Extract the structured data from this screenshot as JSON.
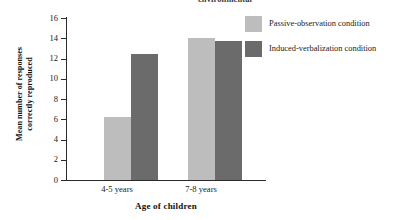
{
  "figure": {
    "cut_off_title": "environmental",
    "background_color": "#ffffff"
  },
  "legend": {
    "position": "top-right",
    "items": [
      {
        "label": "Passive-observation condition",
        "color": "#bdbdbd",
        "swatch_name": "legend-swatch-passive-observation"
      },
      {
        "label": "Induced-verbalization condition",
        "color": "#6b6b6b",
        "swatch_name": "legend-swatch-induced-verbalization"
      }
    ]
  },
  "axes": {
    "y_title_line1": "Mean number of responses",
    "y_title_line2": "correctly reproduced",
    "x_title": "Age of children",
    "y_ticks": [
      "16",
      "14",
      "12",
      "10",
      "8",
      "6",
      "4",
      "2",
      "0"
    ],
    "x_categories": [
      "4-5 years",
      "7-8 years"
    ]
  },
  "chart_data": {
    "type": "bar",
    "title": "environmental",
    "xlabel": "Age of children",
    "ylabel": "Mean number of responses correctly reproduced",
    "categories": [
      "4-5 years",
      "7-8 years"
    ],
    "series": [
      {
        "name": "Passive-observation condition",
        "color": "#bdbdbd",
        "values": [
          6.2,
          14.0
        ]
      },
      {
        "name": "Induced-verbalization condition",
        "color": "#6b6b6b",
        "values": [
          12.4,
          13.7
        ]
      }
    ],
    "ylim": [
      0,
      16
    ],
    "ytick_step": 2,
    "grid": false,
    "legend_position": "top-right"
  }
}
